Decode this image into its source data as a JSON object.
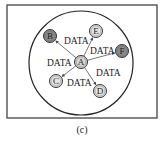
{
  "diagram": {
    "caption": "(c)",
    "frame": {
      "x": 7,
      "y": 5,
      "width": 150,
      "height": 113,
      "stroke": "#444444"
    },
    "boundary": {
      "cx": 81,
      "cy": 63,
      "r": 52,
      "stroke": "#222222"
    },
    "center_node": {
      "id": "A",
      "label": "A",
      "cx": 81,
      "cy": 62,
      "fill": "#d6d6d6"
    },
    "nodes": [
      {
        "id": "B",
        "label": "B",
        "cx": 50,
        "cy": 36,
        "fill": "#8a8a8a"
      },
      {
        "id": "E",
        "label": "E",
        "cx": 96,
        "cy": 31,
        "fill": "#e6e6e6"
      },
      {
        "id": "F",
        "label": "F",
        "cx": 122,
        "cy": 51,
        "fill": "#8a8a8a"
      },
      {
        "id": "C",
        "label": "C",
        "cx": 56,
        "cy": 81,
        "fill": "#e6e6e6"
      },
      {
        "id": "D",
        "label": "D",
        "cx": 100,
        "cy": 91,
        "fill": "#e6e6e6"
      }
    ],
    "edge_labels": [
      {
        "text": "DATA",
        "x": 64,
        "y": 44
      },
      {
        "text": "DATA",
        "x": 90,
        "y": 54
      },
      {
        "text": "DATA",
        "x": 47,
        "y": 66
      },
      {
        "text": "DATA",
        "x": 96,
        "y": 76
      },
      {
        "text": "DATA",
        "x": 67,
        "y": 86
      }
    ],
    "label_text": "DATA"
  }
}
